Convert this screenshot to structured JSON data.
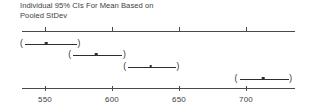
{
  "chart_data": {
    "type": "scatter",
    "title": "Individual 95% CIs For Mean Based on Pooled StDev",
    "title_lines": [
      "Individual 95% CIs For Mean Based on",
      "Pooled StDev"
    ],
    "xlabel": "",
    "ylabel": "",
    "xlim": [
      533,
      737
    ],
    "grid": false,
    "legend": null,
    "axis_ticks": [
      550,
      600,
      650,
      700
    ],
    "tick_labels": [
      "550",
      "600",
      "650",
      "700"
    ],
    "axis_style": "double-rule-top-and-bottom",
    "interval_notation": "(-----*-----)",
    "series": [
      {
        "name": "interval-1",
        "mean": 551,
        "lower": 533,
        "upper": 576,
        "row": 1
      },
      {
        "name": "interval-2",
        "mean": 588,
        "lower": 569,
        "upper": 610,
        "row": 2
      },
      {
        "name": "interval-3",
        "mean": 629,
        "lower": 610,
        "upper": 650,
        "row": 3
      },
      {
        "name": "interval-4",
        "mean": 713,
        "lower": 693,
        "upper": 734,
        "row": 4
      }
    ],
    "colors": {
      "axis": "#4a4a4a",
      "interval": "#2e2e2e",
      "text": "#3d3d3d",
      "background": "#ffffff"
    }
  },
  "glyphs": {
    "paren_left": "(",
    "paren_right": ")"
  }
}
